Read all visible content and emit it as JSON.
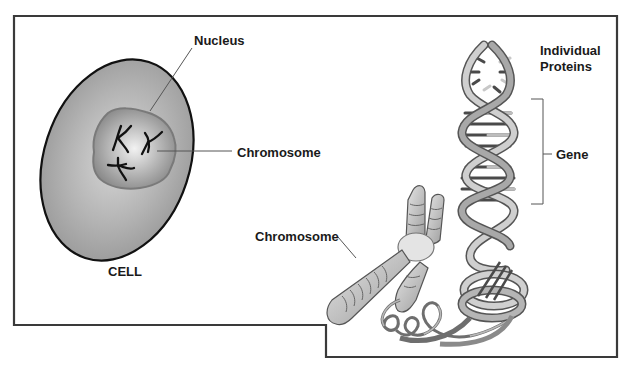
{
  "diagram": {
    "labels": {
      "nucleus": "Nucleus",
      "chromosome_in_cell": "Chromosome",
      "cell": "CELL",
      "chromosome": "Chromosome",
      "proteins_line1": "Individual",
      "proteins_line2": "Proteins",
      "gene": "Gene"
    },
    "colors": {
      "frame": "#3a3a3a",
      "cell_fill": "#a9a9a9",
      "cell_outline": "#111111",
      "nucleus_fill": "#8e8e8e",
      "ribbon_light": "#d4d4d4",
      "ribbon_dark": "#8a8a8a",
      "leader_line": "#555555",
      "text": "#1a1a1a"
    }
  }
}
